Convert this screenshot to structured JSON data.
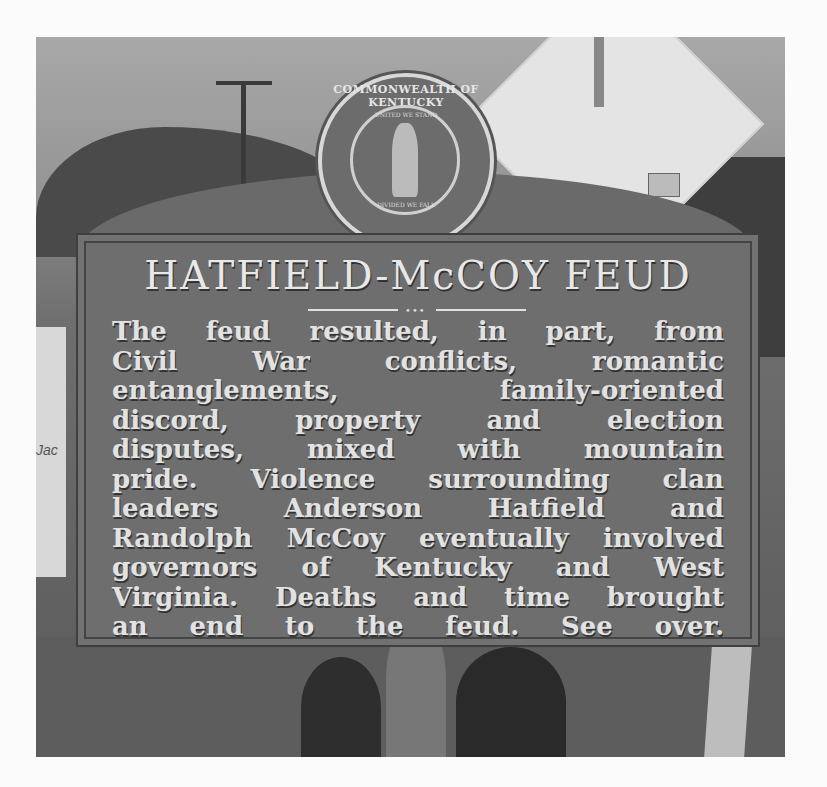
{
  "image": {
    "description": "Grayscale photo of a Kentucky historical roadside marker",
    "seal": {
      "ring_text": "COMMONWEALTH OF KENTUCKY",
      "motto_top": "UNITED WE STAND",
      "motto_bottom": "DIVIDED WE FALL"
    },
    "marker": {
      "title": "HATFIELD-McCOY FEUD",
      "divider": "•••",
      "lines": [
        "The feud resulted, in part, from",
        "Civil War conflicts, romantic",
        "entanglements, family-oriented",
        "discord, property and election",
        "disputes, mixed with mountain",
        "pride. Violence surrounding clan",
        "leaders Anderson Hatfield and",
        "Randolph McCoy eventually involved",
        "governors of Kentucky and West",
        "Virginia. Deaths and time brought",
        "an end to the feud. See over."
      ]
    },
    "background_fragment_text": "Jac"
  }
}
